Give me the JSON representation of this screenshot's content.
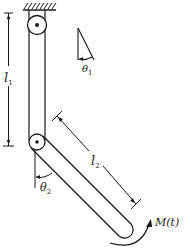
{
  "figure": {
    "type": "double pendulum with applied moment",
    "colors": {
      "stroke": "#1a1a1a",
      "background": "#ffffff"
    }
  },
  "labels": {
    "l1": {
      "main": "l",
      "sub": "1"
    },
    "l2": {
      "main": "l",
      "sub": "2"
    },
    "theta1": {
      "main": "θ",
      "sub": "1"
    },
    "theta2": {
      "main": "θ",
      "sub": "2"
    },
    "moment": "M(t)"
  },
  "components": {
    "ground": "fixed support (hatched)",
    "upper_pivot": "pin joint at support",
    "upper_link": "link of length l1, hanging vertically",
    "lower_pivot": "pin joint between links",
    "lower_link": "link of length l2, rotated by theta2",
    "applied_moment": "moment M(t) at lower end of link 2"
  }
}
